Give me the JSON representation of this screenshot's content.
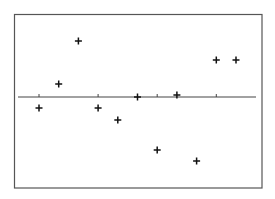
{
  "chart_data": {
    "type": "scatter",
    "title": "",
    "xlabel": "",
    "ylabel": "",
    "grid": false,
    "legend": null,
    "marker": "+",
    "x": [
      0,
      1,
      2,
      3,
      4,
      5,
      6,
      7,
      8,
      9,
      10
    ],
    "y": [
      -11,
      13,
      56,
      -11,
      -23,
      0,
      -53,
      2,
      -64,
      37,
      37
    ],
    "reference_line": {
      "orientation": "horizontal",
      "y": 0
    },
    "x_ticks": [
      0,
      3,
      6,
      9
    ],
    "xlim": [
      -1.1,
      11
    ],
    "ylim": [
      -91,
      83
    ]
  },
  "style": {
    "frame_color": "#555555",
    "axis_color": "#444444",
    "marker_color": "#111111",
    "background": "#ffffff"
  }
}
